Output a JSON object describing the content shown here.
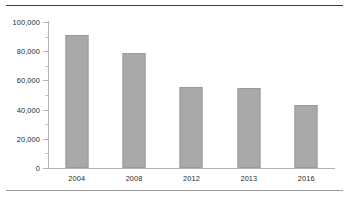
{
  "chart_data": {
    "type": "bar",
    "title": "",
    "subtitle": "",
    "xlabel": "",
    "ylabel": "",
    "categories": [
      "2004",
      "2008",
      "2012",
      "2013",
      "2016"
    ],
    "values": [
      91000,
      78500,
      55500,
      54500,
      43500
    ],
    "series": [
      {
        "name": "",
        "values": [
          91000,
          78500,
          55500,
          54500,
          43500
        ]
      }
    ],
    "ylim": [
      0,
      100000
    ],
    "y_tick_labels": [
      "0",
      "20,000",
      "40,000",
      "60,000",
      "80,000",
      "100,000"
    ],
    "y_tick_values": [
      0,
      20000,
      40000,
      60000,
      80000,
      100000
    ],
    "y_minor_tick_values": [
      10000,
      30000,
      50000,
      70000,
      90000
    ],
    "grid": false,
    "legend": null,
    "annotations": [],
    "bar_color": "#a9a9a9",
    "bar_border_color": "#9a9a9a",
    "axis_color": "#b4b4b4",
    "text_color": "#2b2b2b",
    "rule_top_color": "#3d3d3d",
    "rule_bottom_color": "#9a9a9a"
  }
}
